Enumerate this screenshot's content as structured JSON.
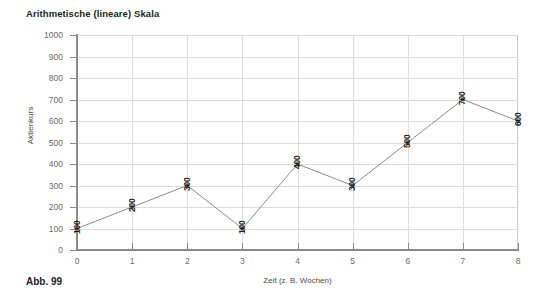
{
  "chart_data": {
    "type": "line",
    "title": "Arithmetische (lineare) Skala",
    "xlabel": "Zeit (z. B. Wochen)",
    "ylabel": "Aktienkurs",
    "x": [
      0,
      1,
      2,
      3,
      4,
      5,
      6,
      7,
      8
    ],
    "values": [
      100,
      200,
      300,
      100,
      400,
      300,
      500,
      700,
      600
    ],
    "point_labels": [
      "100",
      "200",
      "300",
      "100",
      "400",
      "300",
      "500",
      "700",
      "600"
    ],
    "xtick_labels": [
      "0",
      "1",
      "2",
      "3",
      "4",
      "5",
      "6",
      "7",
      "8"
    ],
    "ytick_labels": [
      "0",
      "100",
      "200",
      "300",
      "400",
      "500",
      "600",
      "700",
      "800",
      "900",
      "1000"
    ],
    "yticks": [
      0,
      100,
      200,
      300,
      400,
      500,
      600,
      700,
      800,
      900,
      1000
    ],
    "xlim": [
      0,
      8
    ],
    "ylim": [
      0,
      1000
    ],
    "grid": true,
    "legend": "none",
    "series_color": "#8c8c8c",
    "marker_color": "#4d4d4d",
    "marker": "square",
    "grid_color": "#dcdcdc",
    "axis_color": "#8a8a8a"
  },
  "caption": {
    "figure_label": "Abb. 99"
  }
}
